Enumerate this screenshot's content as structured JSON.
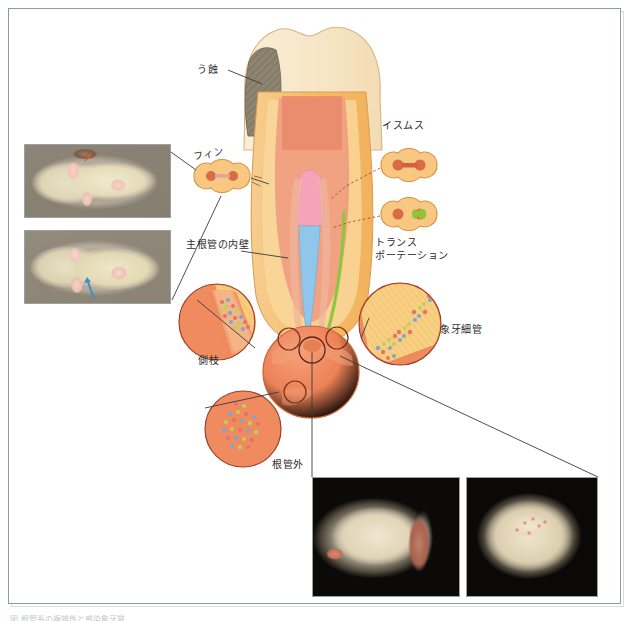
{
  "figure": {
    "frame_color": "#8a9d97",
    "background": "#ffffff"
  },
  "labels": {
    "caries": "う蝕",
    "fin": "フィン",
    "main_canal_wall": "主根管の内壁",
    "isthmus": "イスムス",
    "transportation": "トランス\nポーテーション",
    "lateral_branch": "側枝",
    "dentinal_tubule": "象牙細管",
    "outside_canal": "根管外"
  },
  "photos": [
    {
      "name": "tooth-cross-section-upper",
      "description": "抜去歯の水平断面 — 髄腔と根管の開口部（ピンク）"
    },
    {
      "name": "tooth-cross-section-lower",
      "description": "抜去歯の水平断面 — イスムスを青矢印で示す"
    },
    {
      "name": "tooth-specimen-side",
      "description": "抜去歯の側方面観（黒背景）"
    },
    {
      "name": "tooth-specimen-occlusal",
      "description": "抜去歯の咬合面観（黒背景）"
    }
  ],
  "colors": {
    "enamel": "#f6e6c8",
    "dentin": "#f5b96b",
    "pulp": "#e58b6c",
    "caries": "#8e8571",
    "canal_pink": "#f2a0b4",
    "canal_blue": "#8fc4e8",
    "canal_green": "#8dc63f",
    "lesion": "#ec7f56",
    "outline": "#c46a3c"
  },
  "callouts": [
    {
      "name": "fin-inset",
      "shape": "peanut",
      "label_key": "fin"
    },
    {
      "name": "isthmus-inset",
      "shape": "peanut",
      "label_key": "isthmus"
    },
    {
      "name": "transportation-inset",
      "shape": "peanut",
      "label_key": "transportation"
    },
    {
      "name": "lateral-branch-inset",
      "shape": "circle",
      "label_key": "lateral_branch"
    },
    {
      "name": "dentinal-tubule-inset",
      "shape": "circle",
      "label_key": "dentinal_tubule"
    },
    {
      "name": "outside-canal-inset",
      "shape": "circle",
      "label_key": "outside_canal"
    }
  ],
  "bottom_caption": "図 根管系の複雑性と感染象牙質"
}
